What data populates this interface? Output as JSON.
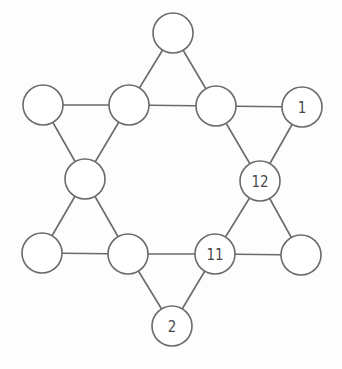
{
  "diagram": {
    "title": "",
    "type": "six-pointed star graph (magic star puzzle)",
    "node_radius": 20,
    "colors": {
      "stroke": "#6a6a6a",
      "label": "#4a4a4a",
      "background": "#fdfdfd"
    },
    "nodes": [
      {
        "id": "top",
        "x": 173,
        "y": 33,
        "label": ""
      },
      {
        "id": "upper-left",
        "x": 43,
        "y": 105,
        "label": ""
      },
      {
        "id": "inner-upper-left",
        "x": 129,
        "y": 105,
        "label": ""
      },
      {
        "id": "inner-upper-right",
        "x": 216,
        "y": 106,
        "label": ""
      },
      {
        "id": "upper-right",
        "x": 302,
        "y": 107,
        "label": "1"
      },
      {
        "id": "inner-left",
        "x": 85,
        "y": 179,
        "label": ""
      },
      {
        "id": "inner-right",
        "x": 260,
        "y": 181,
        "label": "12"
      },
      {
        "id": "lower-left",
        "x": 42,
        "y": 253,
        "label": ""
      },
      {
        "id": "inner-lower-left",
        "x": 128,
        "y": 254,
        "label": ""
      },
      {
        "id": "inner-lower-right",
        "x": 215,
        "y": 254,
        "label": "11"
      },
      {
        "id": "lower-right",
        "x": 301,
        "y": 255,
        "label": ""
      },
      {
        "id": "bottom",
        "x": 172,
        "y": 326,
        "label": "2"
      }
    ],
    "edges": [
      [
        "top",
        "inner-upper-left"
      ],
      [
        "top",
        "inner-upper-right"
      ],
      [
        "upper-left",
        "inner-upper-left"
      ],
      [
        "inner-upper-left",
        "inner-upper-right"
      ],
      [
        "inner-upper-right",
        "upper-right"
      ],
      [
        "upper-left",
        "inner-left"
      ],
      [
        "inner-upper-left",
        "inner-left"
      ],
      [
        "inner-upper-right",
        "inner-right"
      ],
      [
        "upper-right",
        "inner-right"
      ],
      [
        "inner-left",
        "lower-left"
      ],
      [
        "inner-left",
        "inner-lower-left"
      ],
      [
        "inner-right",
        "inner-lower-right"
      ],
      [
        "inner-right",
        "lower-right"
      ],
      [
        "lower-left",
        "inner-lower-left"
      ],
      [
        "inner-lower-left",
        "inner-lower-right"
      ],
      [
        "inner-lower-right",
        "lower-right"
      ],
      [
        "inner-lower-left",
        "bottom"
      ],
      [
        "inner-lower-right",
        "bottom"
      ]
    ]
  }
}
